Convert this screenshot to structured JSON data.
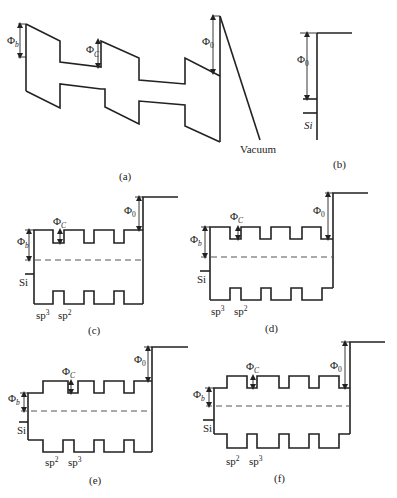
{
  "figure": {
    "panels": [
      {
        "id": "a",
        "caption": "(a)",
        "labels": {
          "phi_b": "Φ",
          "phi_b_sub": "b",
          "phi_c": "Φ",
          "phi_c_sub": "C",
          "phi_0": "Φ",
          "phi_0_sub": "0",
          "vacuum": "Vacuum"
        }
      },
      {
        "id": "b",
        "caption": "(b)",
        "labels": {
          "phi_0": "Φ",
          "phi_0_sub": "0",
          "si": "Si"
        }
      },
      {
        "id": "c",
        "caption": "(c)",
        "labels": {
          "phi_b": "Φ",
          "phi_b_sub": "b",
          "phi_c": "Φ",
          "phi_c_sub": "C",
          "phi_0": "Φ",
          "phi_0_sub": "0",
          "si": "Si",
          "hyb_1": "sp",
          "hyb_1_sup": "3",
          "hyb_2": "sp",
          "hyb_2_sup": "2"
        }
      },
      {
        "id": "d",
        "caption": "(d)",
        "labels": {
          "phi_b": "Φ",
          "phi_b_sub": "b",
          "phi_c": "Φ",
          "phi_c_sub": "C",
          "phi_0": "Φ",
          "phi_0_sub": "0",
          "si": "Si",
          "hyb_1": "sp",
          "hyb_1_sup": "3",
          "hyb_2": "sp",
          "hyb_2_sup": "2"
        }
      },
      {
        "id": "e",
        "caption": "(e)",
        "labels": {
          "phi_b": "Φ",
          "phi_b_sub": "b",
          "phi_c": "Φ",
          "phi_c_sub": "C",
          "phi_0": "Φ",
          "phi_0_sub": "0",
          "si": "Si",
          "hyb_1": "sp",
          "hyb_1_sup": "2",
          "hyb_2": "sp",
          "hyb_2_sup": "3"
        }
      },
      {
        "id": "f",
        "caption": "(f)",
        "labels": {
          "phi_b": "Φ",
          "phi_b_sub": "b",
          "phi_c": "Φ",
          "phi_c_sub": "C",
          "phi_0": "Φ",
          "phi_0_sub": "0",
          "si": "Si",
          "hyb_1": "sp",
          "hyb_1_sup": "2",
          "hyb_2": "sp",
          "hyb_2_sup": "3"
        }
      }
    ]
  }
}
